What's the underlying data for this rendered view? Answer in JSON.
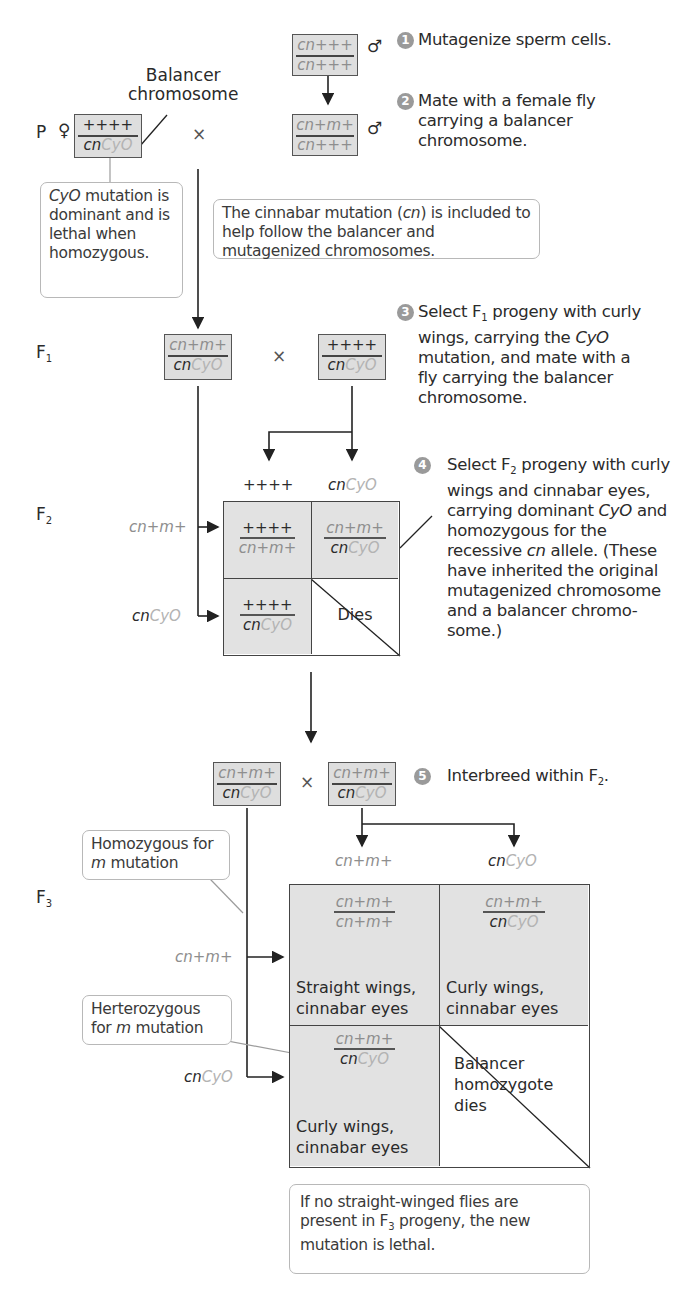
{
  "generations": {
    "p": "P",
    "f1": "F",
    "f1_sub": "1",
    "f2": "F",
    "f2_sub": "2",
    "f3": "F",
    "f3_sub": "3"
  },
  "symbols": {
    "female": "♀",
    "male": "♂",
    "cross": "×"
  },
  "balancer_label": [
    "Balancer",
    "chromosome"
  ],
  "genotypes": {
    "male_initial": {
      "top": "cn+++",
      "bottom": "cn+++"
    },
    "male_mutagenized": {
      "top": "cn+m+",
      "bottom": "cn+++"
    },
    "p_female": {
      "top": "++++",
      "bottom_a": "cn",
      "bottom_b": "CyO"
    },
    "f1_left": {
      "top": "cn+m+",
      "bottom_a": "cn",
      "bottom_b": "CyO"
    },
    "f1_right": {
      "top": "++++",
      "bottom_a": "cn",
      "bottom_b": "CyO"
    },
    "f2_left": {
      "top": "cn+m+",
      "bottom_a": "cn",
      "bottom_b": "CyO"
    },
    "f2_right": {
      "top": "cn+m+",
      "bottom_a": "cn",
      "bottom_b": "CyO"
    }
  },
  "steps": [
    {
      "n": "1",
      "text": "Mutagenize sperm cells."
    },
    {
      "n": "2",
      "text": "Mate with a female fly carrying a balancer chromosome."
    },
    {
      "n": "3",
      "text_a": "Select F",
      "sub": "1",
      "text_b": " progeny with curly wings, carrying the ",
      "italic": "CyO",
      "text_c": " mutation, and mate with a fly carrying the balancer chromosome."
    },
    {
      "n": "4",
      "text_a": "Select F",
      "sub": "2",
      "text_b": " progeny with curly wings and cinnabar eyes, carrying dominant ",
      "italic": "CyO",
      "text_c": " and homozygous for the recessive ",
      "italic2": "cn",
      "text_d": " allele. (These have inherited the original mutagenized chromosome and a balancer chromo-some.)"
    },
    {
      "n": "5",
      "text_a": "Interbreed within F",
      "sub": "2",
      "text_b": "."
    }
  ],
  "notes": {
    "cyo": {
      "italic": "CyO",
      "text": " mutation is dominant and is lethal when homozygous."
    },
    "cinnabar": {
      "text_a": "The cinnabar mutation (",
      "italic": "cn",
      "text_b": ") is included to help follow the balancer and mutagenized chromosomes."
    },
    "homozygous": {
      "text_a": "Homozygous for ",
      "italic": "m",
      "text_b": " mutation"
    },
    "heterozygous": {
      "text_a": "Herterozygous for ",
      "italic": "m",
      "text_b": " mutation"
    },
    "conclusion": {
      "text_a": "If no straight-winged flies are present in F",
      "sub": "3",
      "text_b": " progeny, the new mutation is lethal."
    }
  },
  "f2_grid": {
    "col_headers": [
      "++++",
      "cnCyO"
    ],
    "row_headers": [
      "cn+m+",
      "cnCyO"
    ],
    "cells": [
      {
        "top": "++++",
        "bottom": "cn+m+"
      },
      {
        "top": "cn+m+",
        "bottom": "cnCyO"
      },
      {
        "top": "++++",
        "bottom": "cnCyO"
      },
      {
        "label": "Dies"
      }
    ]
  },
  "f3_grid": {
    "col_headers": [
      "cn+m+",
      "cnCyO"
    ],
    "row_headers": [
      "cn+m+",
      "cnCyO"
    ],
    "cells": [
      {
        "top": "cn+m+",
        "bottom": "cn+m+",
        "phenotype": [
          "Straight wings,",
          "cinnabar eyes"
        ]
      },
      {
        "top": "cn+m+",
        "bottom": "cnCyO",
        "phenotype": [
          "Curly wings,",
          "cinnabar eyes"
        ]
      },
      {
        "top": "cn+m+",
        "bottom": "cnCyO",
        "phenotype": [
          "Curly wings,",
          "cinnabar eyes"
        ]
      },
      {
        "label": [
          "Balancer",
          "homozygote",
          "dies"
        ]
      }
    ]
  },
  "colors": {
    "cell_shade": "#e2e2e2",
    "badge": "#9a9a9a",
    "balancer_text": "#b3b3b3",
    "mutagenized_text": "#8e8e8e"
  }
}
